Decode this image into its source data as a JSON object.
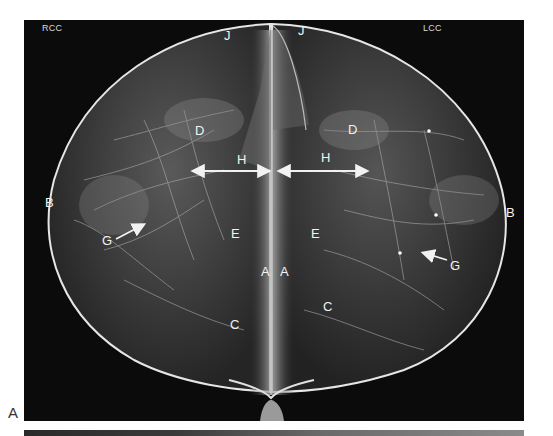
{
  "figure": {
    "panel_label": "A",
    "views": {
      "left": "RCC",
      "right": "LCC"
    },
    "labels": [
      {
        "id": "j-left",
        "text": "J",
        "x": 200,
        "y": 9
      },
      {
        "id": "j-right",
        "text": "J",
        "x": 274,
        "y": 4
      },
      {
        "id": "d-left",
        "text": "D",
        "x": 171,
        "y": 104
      },
      {
        "id": "d-right",
        "text": "D",
        "x": 324,
        "y": 103
      },
      {
        "id": "h-left",
        "text": "H",
        "x": 213,
        "y": 133
      },
      {
        "id": "h-right",
        "text": "H",
        "x": 297,
        "y": 131
      },
      {
        "id": "b-left",
        "text": "B",
        "x": 21,
        "y": 176
      },
      {
        "id": "b-right",
        "text": "B",
        "x": 482,
        "y": 186
      },
      {
        "id": "g-left",
        "text": "G",
        "x": 78,
        "y": 214
      },
      {
        "id": "g-right",
        "text": "G",
        "x": 426,
        "y": 239
      },
      {
        "id": "e-left",
        "text": "E",
        "x": 207,
        "y": 207
      },
      {
        "id": "e-right",
        "text": "E",
        "x": 287,
        "y": 207
      },
      {
        "id": "a-left",
        "text": "A",
        "x": 237,
        "y": 245
      },
      {
        "id": "a-right",
        "text": "A",
        "x": 256,
        "y": 245
      },
      {
        "id": "c-left",
        "text": "C",
        "x": 206,
        "y": 298
      },
      {
        "id": "c-right",
        "text": "C",
        "x": 299,
        "y": 280
      }
    ],
    "colors": {
      "background": "#0b0b0b",
      "skin_line": "#e8e8e8",
      "tissue": "#9a9a9a",
      "label": "#f2f2f2"
    }
  }
}
